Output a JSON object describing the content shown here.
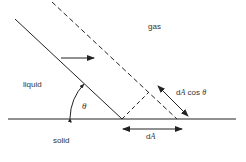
{
  "diagram": {
    "labels": {
      "gas": "gas",
      "liquid": "liquid",
      "solid": "solid",
      "theta": "θ",
      "dA_cos_prefix": "d",
      "dA_cos_A": "A",
      "dA_cos_suffix": " cos ",
      "dA_cos_theta": "θ",
      "dA_prefix": "d",
      "dA_A": "A"
    },
    "colors": {
      "line": "#222222",
      "text": "#333333",
      "background": "#ffffff"
    }
  }
}
